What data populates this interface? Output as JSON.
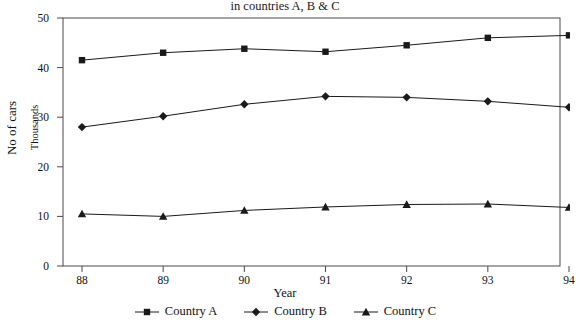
{
  "chart_data": {
    "type": "line",
    "title": "No of cars sold by dealers",
    "subtitle": "in countries A, B & C",
    "xlabel": "Year",
    "ylabel": "No of cars",
    "ylabel_secondary": "Thousands",
    "categories": [
      "88",
      "89",
      "90",
      "91",
      "92",
      "93",
      "94"
    ],
    "x": [
      88,
      89,
      90,
      91,
      92,
      93,
      94
    ],
    "ylim": [
      0,
      50
    ],
    "yticks": [
      0,
      10,
      20,
      30,
      40,
      50
    ],
    "grid": false,
    "legend_position": "bottom",
    "series": [
      {
        "name": "Country A",
        "marker": "square",
        "color": "#1a1a1a",
        "values": [
          41.5,
          43.0,
          43.8,
          43.2,
          44.5,
          46.0,
          46.5
        ]
      },
      {
        "name": "Country B",
        "marker": "diamond",
        "color": "#1a1a1a",
        "values": [
          28.0,
          30.2,
          32.6,
          34.2,
          34.0,
          33.2,
          32.0
        ]
      },
      {
        "name": "Country C",
        "marker": "triangle",
        "color": "#1a1a1a",
        "values": [
          10.5,
          10.0,
          11.2,
          11.9,
          12.4,
          12.5,
          11.8
        ]
      }
    ]
  },
  "axes": {
    "y_tick_labels": [
      "50",
      "40",
      "30",
      "20",
      "10",
      "0"
    ],
    "x_tick_labels": [
      "88",
      "89",
      "90",
      "91",
      "92",
      "93",
      "94"
    ]
  },
  "legend": {
    "items": [
      {
        "label": "Country A",
        "marker": "square-marker-icon"
      },
      {
        "label": "Country B",
        "marker": "diamond-marker-icon"
      },
      {
        "label": "Country C",
        "marker": "triangle-marker-icon"
      }
    ]
  }
}
